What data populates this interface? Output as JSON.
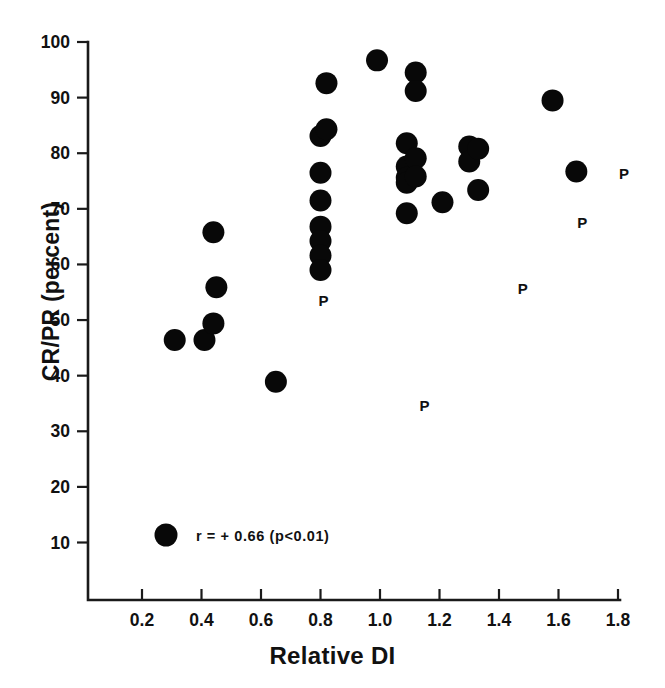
{
  "chart_data": {
    "type": "scatter",
    "title": "",
    "xlabel": "Relative DI",
    "ylabel": "CR/PR (percent)",
    "xlim": [
      0.1,
      1.87
    ],
    "ylim": [
      4.0,
      100.0
    ],
    "grid": false,
    "legend_position": "inside-bottom-left",
    "xticks": [
      "0.2",
      "0.4",
      "0.6",
      "0.8",
      "1.0",
      "1.2",
      "1.4",
      "1.6",
      "1.8"
    ],
    "xtick_values": [
      0.2,
      0.4,
      0.6,
      0.8,
      1.0,
      1.2,
      1.4,
      1.6,
      1.8
    ],
    "yticks": [
      "10",
      "20",
      "30",
      "40",
      "50",
      "60",
      "70",
      "80",
      "90",
      "100"
    ],
    "ytick_values": [
      10,
      20,
      30,
      40,
      50,
      60,
      70,
      80,
      90,
      100
    ],
    "annotation": "r = + 0.66 (p<0.01)",
    "correlation_r": 0.66,
    "p_value_text": "p<0.01",
    "marker_shape": "filled-circle",
    "marker_color": "#080808",
    "marker_radius_px": 11,
    "series": [
      {
        "name": "patients",
        "marker": "filled-circle",
        "points": [
          {
            "x": 0.31,
            "y": 46.4
          },
          {
            "x": 0.41,
            "y": 46.4
          },
          {
            "x": 0.44,
            "y": 65.8
          },
          {
            "x": 0.44,
            "y": 49.4
          },
          {
            "x": 0.45,
            "y": 55.9
          },
          {
            "x": 0.65,
            "y": 38.9
          },
          {
            "x": 0.8,
            "y": 83.1
          },
          {
            "x": 0.8,
            "y": 76.5
          },
          {
            "x": 0.8,
            "y": 71.5
          },
          {
            "x": 0.8,
            "y": 66.8
          },
          {
            "x": 0.8,
            "y": 64.2
          },
          {
            "x": 0.8,
            "y": 61.6
          },
          {
            "x": 0.8,
            "y": 59.0
          },
          {
            "x": 0.82,
            "y": 92.6
          },
          {
            "x": 0.82,
            "y": 84.3
          },
          {
            "x": 0.99,
            "y": 96.7
          },
          {
            "x": 1.09,
            "y": 81.8
          },
          {
            "x": 1.09,
            "y": 77.6
          },
          {
            "x": 1.09,
            "y": 75.6
          },
          {
            "x": 1.09,
            "y": 74.7
          },
          {
            "x": 1.09,
            "y": 69.2
          },
          {
            "x": 1.12,
            "y": 94.5
          },
          {
            "x": 1.12,
            "y": 91.2
          },
          {
            "x": 1.12,
            "y": 79.1
          },
          {
            "x": 1.12,
            "y": 75.8
          },
          {
            "x": 1.21,
            "y": 71.2
          },
          {
            "x": 1.3,
            "y": 81.2
          },
          {
            "x": 1.3,
            "y": 78.5
          },
          {
            "x": 1.33,
            "y": 80.8
          },
          {
            "x": 1.33,
            "y": 73.4
          },
          {
            "x": 1.58,
            "y": 89.5
          },
          {
            "x": 1.66,
            "y": 76.7
          }
        ]
      },
      {
        "name": "p-labels",
        "marker": "letter-P",
        "points": [
          {
            "x": 0.81,
            "y": 53.5
          },
          {
            "x": 1.15,
            "y": 34.5
          },
          {
            "x": 1.48,
            "y": 55.6
          },
          {
            "x": 1.68,
            "y": 67.5
          },
          {
            "x": 1.82,
            "y": 76.2
          }
        ]
      }
    ],
    "legend": [
      {
        "marker": "filled-circle",
        "label": "r = + 0.66 (p<0.01)"
      }
    ]
  },
  "axis": {
    "x_title": "Relative DI",
    "y_title": "CR/PR (percent)"
  },
  "legend_entry": {
    "label": "r = + 0.66 (p<0.01)"
  },
  "p_marker": {
    "glyph": "P"
  }
}
